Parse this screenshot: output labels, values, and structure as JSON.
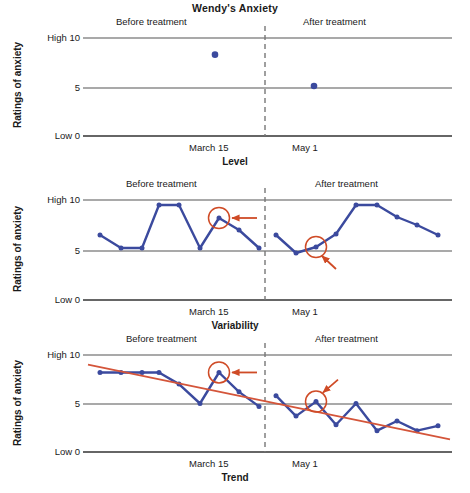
{
  "figure": {
    "title": "Wendy's Anxiety",
    "y_axis_title": "Ratings of anxiety",
    "y_tick_high": "High 10",
    "y_tick_mid": "5",
    "y_tick_low": "Low 0",
    "phase_before": "Before treatment",
    "phase_after": "After treatment",
    "x_tick_before": "March 15",
    "x_tick_after": "May 1",
    "colors": {
      "series": "#3b4a9e",
      "annotation": "#cf4b26",
      "axis": "#555555",
      "phase_divider": "#777777",
      "trend": "#d4553a"
    }
  },
  "panels": [
    {
      "caption": "Level"
    },
    {
      "caption": "Variability"
    },
    {
      "caption": "Trend"
    }
  ],
  "chart_data": [
    {
      "type": "scatter",
      "title": "Wendy's Anxiety",
      "panel": "Level",
      "xlabel": "",
      "ylabel": "Ratings of anxiety",
      "ylim": [
        0,
        10
      ],
      "ytick_labels": [
        "Low 0",
        "5",
        "High 10"
      ],
      "ytick_values": [
        0,
        5,
        10
      ],
      "grid": false,
      "legend": "none",
      "phase_divider_after_index": 0,
      "annotations": [
        "Before treatment",
        "After treatment",
        "March 15",
        "May 1"
      ],
      "series": [
        {
          "name": "Mean rating",
          "points": [
            {
              "label": "Before treatment mean",
              "x": 6,
              "y": 8.3
            },
            {
              "label": "After treatment mean",
              "x": 16,
              "y": 5.1
            }
          ]
        }
      ]
    },
    {
      "type": "line",
      "panel": "Variability",
      "xlabel": "",
      "ylabel": "Ratings of anxiety",
      "ylim": [
        0,
        10
      ],
      "ytick_labels": [
        "Low 0",
        "5",
        "High 10"
      ],
      "ytick_values": [
        0,
        5,
        10
      ],
      "grid": false,
      "legend": "none",
      "phase_divider_after_index": 8,
      "series": [
        {
          "name": "Before treatment",
          "values": [
            6.5,
            5.2,
            5.2,
            9.5,
            9.5,
            5.2,
            8.2,
            7.0,
            5.2
          ]
        },
        {
          "name": "After treatment",
          "values": [
            6.5,
            4.7,
            5.3,
            6.6,
            9.5,
            9.5,
            8.3,
            7.5,
            6.5
          ]
        }
      ],
      "circled_points": [
        {
          "phase": "Before treatment",
          "index": 6,
          "value": 8.2
        },
        {
          "phase": "After treatment",
          "index": 2,
          "value": 5.3
        }
      ]
    },
    {
      "type": "line",
      "panel": "Trend",
      "xlabel": "",
      "ylabel": "Ratings of anxiety",
      "ylim": [
        0,
        10
      ],
      "ytick_labels": [
        "Low 0",
        "5",
        "High 10"
      ],
      "ytick_values": [
        0,
        5,
        10
      ],
      "grid": false,
      "legend": "none",
      "phase_divider_after_index": 8,
      "series": [
        {
          "name": "Before treatment",
          "values": [
            8.2,
            8.2,
            8.2,
            8.2,
            7.0,
            5.0,
            8.2,
            6.2,
            4.7
          ]
        },
        {
          "name": "After treatment",
          "values": [
            5.8,
            3.7,
            5.2,
            2.8,
            5.0,
            2.2,
            3.2,
            2.2,
            2.7
          ]
        }
      ],
      "trend_line": {
        "name": "Linear trend",
        "start": [
          0,
          9.0
        ],
        "end": [
          17,
          1.3
        ]
      },
      "circled_points": [
        {
          "phase": "Before treatment",
          "index": 6,
          "value": 8.2
        },
        {
          "phase": "After treatment",
          "index": 2,
          "value": 5.2
        }
      ]
    }
  ]
}
